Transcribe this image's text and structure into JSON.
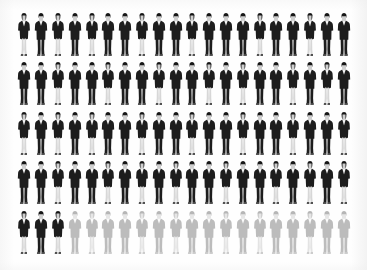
{
  "graphic": {
    "type": "pictogram-unit-chart",
    "icon_name": "business-person-icon",
    "title": "",
    "caption": "",
    "background_color": "#ffffff",
    "filled_color": "#1d1d1d",
    "faded_color": "#bcbcbc",
    "columns": 20,
    "rows": 5,
    "total_units": 100,
    "filled_units": 83,
    "faded_units": 17,
    "unit_value": 1,
    "percent_filled": "83%",
    "percent_faded": "17%",
    "alt_text": "Pictogram of 100 business people arranged in 5 rows of 20; the first 83 figures are solid dark and the final 17 are faded grey."
  },
  "chart_data": {
    "type": "bar",
    "title": "",
    "xlabel": "",
    "ylabel": "",
    "categories": [
      "Filled",
      "Faded"
    ],
    "values": [
      83,
      17
    ],
    "ylim": [
      0,
      100
    ],
    "legend": [
      {
        "label": "Filled (highlighted)",
        "color": "#1d1d1d",
        "count": 83
      },
      {
        "label": "Faded (remainder)",
        "color": "#bcbcbc",
        "count": 17
      }
    ],
    "grid": false
  },
  "figures": [
    {
      "variant": "female",
      "state": "on"
    },
    {
      "variant": "male",
      "state": "on"
    },
    {
      "variant": "female",
      "state": "on"
    },
    {
      "variant": "male",
      "state": "on"
    },
    {
      "variant": "female",
      "state": "on"
    },
    {
      "variant": "male",
      "state": "on"
    },
    {
      "variant": "male",
      "state": "on"
    },
    {
      "variant": "female",
      "state": "on"
    },
    {
      "variant": "male",
      "state": "on"
    },
    {
      "variant": "male",
      "state": "on"
    },
    {
      "variant": "female",
      "state": "on"
    },
    {
      "variant": "male",
      "state": "on"
    },
    {
      "variant": "male",
      "state": "on"
    },
    {
      "variant": "male",
      "state": "on"
    },
    {
      "variant": "female",
      "state": "on"
    },
    {
      "variant": "male",
      "state": "on"
    },
    {
      "variant": "male",
      "state": "on"
    },
    {
      "variant": "female",
      "state": "on"
    },
    {
      "variant": "male",
      "state": "on"
    },
    {
      "variant": "male",
      "state": "on"
    },
    {
      "variant": "male",
      "state": "on"
    },
    {
      "variant": "male",
      "state": "on"
    },
    {
      "variant": "female",
      "state": "on"
    },
    {
      "variant": "male",
      "state": "on"
    },
    {
      "variant": "male",
      "state": "on"
    },
    {
      "variant": "female",
      "state": "on"
    },
    {
      "variant": "male",
      "state": "on"
    },
    {
      "variant": "male",
      "state": "on"
    },
    {
      "variant": "female",
      "state": "on"
    },
    {
      "variant": "male",
      "state": "on"
    },
    {
      "variant": "male",
      "state": "on"
    },
    {
      "variant": "female",
      "state": "on"
    },
    {
      "variant": "male",
      "state": "on"
    },
    {
      "variant": "female",
      "state": "on"
    },
    {
      "variant": "male",
      "state": "on"
    },
    {
      "variant": "male",
      "state": "on"
    },
    {
      "variant": "female",
      "state": "on"
    },
    {
      "variant": "male",
      "state": "on"
    },
    {
      "variant": "female",
      "state": "on"
    },
    {
      "variant": "male",
      "state": "on"
    },
    {
      "variant": "female",
      "state": "on"
    },
    {
      "variant": "male",
      "state": "on"
    },
    {
      "variant": "female",
      "state": "on"
    },
    {
      "variant": "male",
      "state": "on"
    },
    {
      "variant": "female",
      "state": "on"
    },
    {
      "variant": "male",
      "state": "on"
    },
    {
      "variant": "male",
      "state": "on"
    },
    {
      "variant": "female",
      "state": "on"
    },
    {
      "variant": "male",
      "state": "on"
    },
    {
      "variant": "male",
      "state": "on"
    },
    {
      "variant": "female",
      "state": "on"
    },
    {
      "variant": "male",
      "state": "on"
    },
    {
      "variant": "male",
      "state": "on"
    },
    {
      "variant": "female",
      "state": "on"
    },
    {
      "variant": "male",
      "state": "on"
    },
    {
      "variant": "male",
      "state": "on"
    },
    {
      "variant": "female",
      "state": "on"
    },
    {
      "variant": "male",
      "state": "on"
    },
    {
      "variant": "male",
      "state": "on"
    },
    {
      "variant": "female",
      "state": "on"
    },
    {
      "variant": "male",
      "state": "on"
    },
    {
      "variant": "male",
      "state": "on"
    },
    {
      "variant": "female",
      "state": "on"
    },
    {
      "variant": "male",
      "state": "on"
    },
    {
      "variant": "male",
      "state": "on"
    },
    {
      "variant": "female",
      "state": "on"
    },
    {
      "variant": "male",
      "state": "on"
    },
    {
      "variant": "female",
      "state": "on"
    },
    {
      "variant": "male",
      "state": "on"
    },
    {
      "variant": "female",
      "state": "on"
    },
    {
      "variant": "male",
      "state": "on"
    },
    {
      "variant": "male",
      "state": "on"
    },
    {
      "variant": "female",
      "state": "on"
    },
    {
      "variant": "male",
      "state": "on"
    },
    {
      "variant": "male",
      "state": "on"
    },
    {
      "variant": "female",
      "state": "on"
    },
    {
      "variant": "male",
      "state": "on"
    },
    {
      "variant": "female",
      "state": "on"
    },
    {
      "variant": "male",
      "state": "on"
    },
    {
      "variant": "female",
      "state": "on"
    },
    {
      "variant": "female",
      "state": "on"
    },
    {
      "variant": "male",
      "state": "on"
    },
    {
      "variant": "female",
      "state": "on"
    },
    {
      "variant": "male",
      "state": "off"
    },
    {
      "variant": "female",
      "state": "off"
    },
    {
      "variant": "male",
      "state": "off"
    },
    {
      "variant": "male",
      "state": "off"
    },
    {
      "variant": "female",
      "state": "off"
    },
    {
      "variant": "male",
      "state": "off"
    },
    {
      "variant": "female",
      "state": "off"
    },
    {
      "variant": "male",
      "state": "off"
    },
    {
      "variant": "male",
      "state": "off"
    },
    {
      "variant": "female",
      "state": "off"
    },
    {
      "variant": "male",
      "state": "off"
    },
    {
      "variant": "female",
      "state": "off"
    },
    {
      "variant": "male",
      "state": "off"
    },
    {
      "variant": "male",
      "state": "off"
    },
    {
      "variant": "female",
      "state": "off"
    },
    {
      "variant": "male",
      "state": "off"
    },
    {
      "variant": "male",
      "state": "off"
    }
  ]
}
